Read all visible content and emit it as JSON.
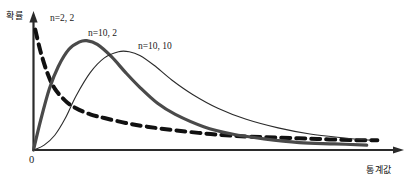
{
  "figure": {
    "axis_labels": {
      "y": "확률",
      "x": "통계값",
      "origin": "0"
    },
    "colors": {
      "ink": "#1a1a1a",
      "axis": "#2b2b2b",
      "curve_thick": "#4a4a4a",
      "curve_thin": "#2b2b2b",
      "curve_dashed": "#111111"
    }
  },
  "chart_data": {
    "type": "line",
    "title": "",
    "subtitle": "",
    "xlabel": "통계값",
    "ylabel": "확률",
    "grid": false,
    "legend_position": "inline-annotations",
    "axis_arrows": true,
    "xlim": [
      0,
      10
    ],
    "ylim": [
      0,
      1.05
    ],
    "x_tick_labels": [
      "0"
    ],
    "y_tick_labels": [],
    "annotations": [
      {
        "text": "n=2, 2",
        "series": "n=2, 2",
        "x": 0.55,
        "y": 1.0
      },
      {
        "text": "n=10, 2",
        "series": "n=10, 2",
        "x": 1.75,
        "y": 0.88
      },
      {
        "text": "n=10, 10",
        "series": "n=10, 10",
        "x": 3.15,
        "y": 0.77
      }
    ],
    "series": [
      {
        "name": "n=2, 2",
        "label": "n=2, 2",
        "style": "dashed",
        "linewidth": 4,
        "color": "#111111",
        "x": [
          0.05,
          0.2,
          0.4,
          0.6,
          0.9,
          1.2,
          1.6,
          2.0,
          2.6,
          3.2,
          4.0,
          5.0,
          6.0,
          7.0,
          8.0,
          9.0,
          9.7
        ],
        "y": [
          0.98,
          0.8,
          0.62,
          0.5,
          0.4,
          0.34,
          0.29,
          0.26,
          0.22,
          0.19,
          0.16,
          0.13,
          0.11,
          0.1,
          0.09,
          0.08,
          0.08
        ]
      },
      {
        "name": "n=10, 2",
        "label": "n=10, 2",
        "style": "solid",
        "linewidth": 3.2,
        "color": "#4a4a4a",
        "x": [
          0.0,
          0.2,
          0.45,
          0.7,
          1.0,
          1.3,
          1.5,
          1.8,
          2.2,
          2.6,
          3.0,
          3.5,
          4.0,
          4.8,
          5.6,
          6.5,
          7.5,
          8.5,
          9.4
        ],
        "y": [
          0.0,
          0.24,
          0.5,
          0.68,
          0.82,
          0.88,
          0.89,
          0.86,
          0.76,
          0.63,
          0.51,
          0.38,
          0.29,
          0.19,
          0.13,
          0.09,
          0.06,
          0.05,
          0.04
        ]
      },
      {
        "name": "n=10, 10",
        "label": "n=10, 10",
        "style": "solid",
        "linewidth": 1.1,
        "color": "#2b2b2b",
        "x": [
          0.0,
          0.3,
          0.6,
          0.9,
          1.2,
          1.6,
          2.0,
          2.4,
          2.7,
          3.0,
          3.4,
          3.9,
          4.5,
          5.2,
          6.0,
          6.9,
          7.8,
          8.7,
          9.5
        ],
        "y": [
          0.0,
          0.04,
          0.12,
          0.26,
          0.44,
          0.63,
          0.75,
          0.8,
          0.8,
          0.77,
          0.69,
          0.57,
          0.45,
          0.34,
          0.25,
          0.18,
          0.13,
          0.1,
          0.08
        ]
      }
    ]
  }
}
